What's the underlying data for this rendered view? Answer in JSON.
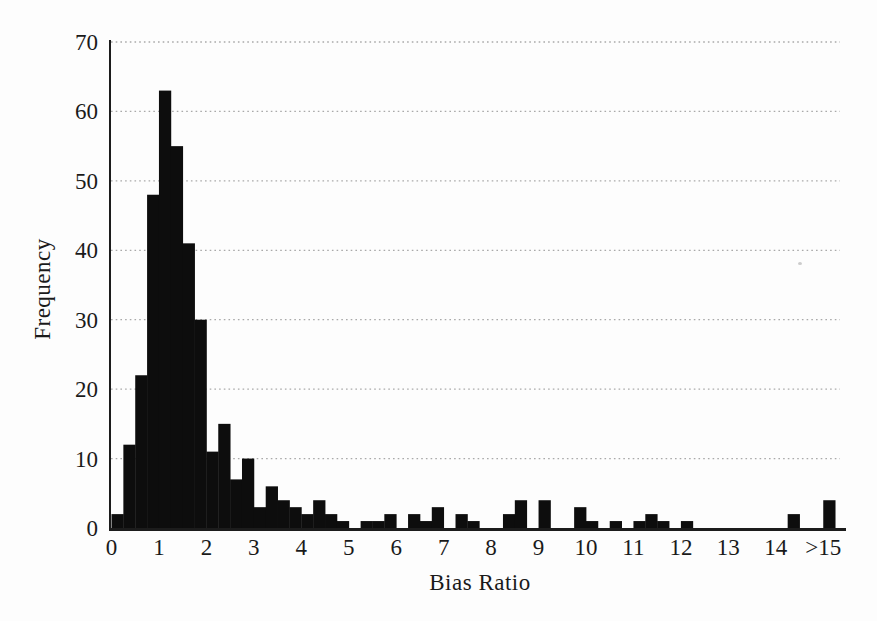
{
  "figure": {
    "background_color": "#fdfdfd",
    "bar_color": "#0d0d0d",
    "axis_color": "#1c1c1c",
    "grid_color": "#a9a9a9",
    "text_color": "#1a1a1a"
  },
  "chart_data": {
    "type": "bar",
    "title": "",
    "xlabel": "Bias Ratio",
    "ylabel": "Frequency",
    "xlim": [
      0,
      15.5
    ],
    "ylim": [
      0,
      70
    ],
    "grid": "dotted horizontal lines at every y tick",
    "legend_position": "none",
    "bin_width": 0.25,
    "x_tick_labels": [
      "0",
      "1",
      "2",
      "3",
      "4",
      "5",
      "6",
      "7",
      "8",
      "9",
      "10",
      "11",
      "12",
      "13",
      "14",
      ">15"
    ],
    "x_tick_values": [
      0,
      1,
      2,
      3,
      4,
      5,
      6,
      7,
      8,
      9,
      10,
      11,
      12,
      13,
      14,
      15
    ],
    "y_tick_labels": [
      "0",
      "10",
      "20",
      "30",
      "40",
      "50",
      "60",
      "70"
    ],
    "y_tick_values": [
      0,
      10,
      20,
      30,
      40,
      50,
      60,
      70
    ],
    "bin_start": [
      0,
      0.25,
      0.5,
      0.75,
      1,
      1.25,
      1.5,
      1.75,
      2,
      2.25,
      2.5,
      2.75,
      3,
      3.25,
      3.5,
      3.75,
      4,
      4.25,
      4.5,
      4.75,
      5,
      5.25,
      5.5,
      5.75,
      6,
      6.25,
      6.5,
      6.75,
      7,
      7.25,
      7.5,
      7.75,
      8,
      8.25,
      8.5,
      8.75,
      9,
      9.25,
      9.5,
      9.75,
      10,
      10.25,
      10.5,
      10.75,
      11,
      11.25,
      11.5,
      11.75,
      12,
      12.25,
      12.5,
      12.75,
      13,
      13.25,
      13.5,
      13.75,
      14,
      14.25,
      14.5,
      14.75,
      15
    ],
    "frequency": [
      2,
      12,
      22,
      48,
      63,
      55,
      41,
      30,
      11,
      15,
      7,
      10,
      3,
      6,
      4,
      3,
      2,
      4,
      2,
      1,
      0,
      1,
      1,
      2,
      0,
      2,
      1,
      3,
      0,
      2,
      1,
      0,
      0,
      2,
      4,
      0,
      4,
      0,
      0,
      3,
      1,
      0,
      1,
      0,
      1,
      2,
      1,
      0,
      1,
      0,
      0,
      0,
      0,
      0,
      0,
      0,
      0,
      2,
      0,
      0,
      4
    ],
    "last_bin_note": "final bar is the >15 overflow bin"
  }
}
